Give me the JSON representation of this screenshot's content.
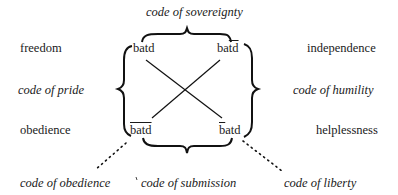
{
  "diagram": {
    "top_code": "code of sovereignty",
    "bottom_code": "code of submission",
    "left_code": "code of pride",
    "right_code": "code of humility",
    "diag_left_code": "code of obedience",
    "diag_right_code": "code of liberty",
    "left_labels": {
      "top": "freedom",
      "bottom": "obedience"
    },
    "right_labels": {
      "top": "independence",
      "bottom": "helplessness"
    },
    "nodes": {
      "top_left": {
        "text": "batd",
        "overline": "none"
      },
      "top_right": {
        "prefix": "ba",
        "over": "td",
        "overline": "td"
      },
      "bottom_left": {
        "over": "batd",
        "overline": "all"
      },
      "bottom_right": {
        "over": "b",
        "suffix": "atd",
        "overline": "b"
      }
    },
    "stroke_color": "#111111"
  }
}
